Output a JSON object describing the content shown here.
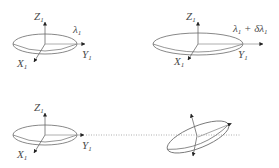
{
  "diagram": {
    "colors": {
      "stroke": "#6a6a6a",
      "arrow": "#222222",
      "dotted": "#9a9a9a",
      "text": "#4a4a4a",
      "background": "#ffffff"
    },
    "panels": [
      {
        "id": "top-left",
        "shape": "ellipsoid",
        "axes": {
          "z": "Z",
          "y": "Y",
          "x": "X",
          "subscript": "1"
        },
        "eigenvalue_label": "λ",
        "eigenvalue_sub": "1"
      },
      {
        "id": "top-right",
        "shape": "elongated-ellipsoid",
        "axes": {
          "z": "Z",
          "y": "Y",
          "x": "X",
          "subscript": "1"
        },
        "eigenvalue_label": "λ",
        "eigenvalue_sub": "1",
        "perturbation_label": " + δλ",
        "perturbation_sub": "1"
      },
      {
        "id": "bottom-left",
        "shape": "ellipsoid",
        "axes": {
          "z": "Z",
          "y": "Y",
          "x": "X",
          "subscript": "1"
        }
      },
      {
        "id": "bottom-right",
        "shape": "rotated-ellipsoid",
        "axes": {}
      }
    ],
    "connector": {
      "style": "dotted",
      "from": "bottom-left",
      "to": "bottom-right"
    }
  }
}
